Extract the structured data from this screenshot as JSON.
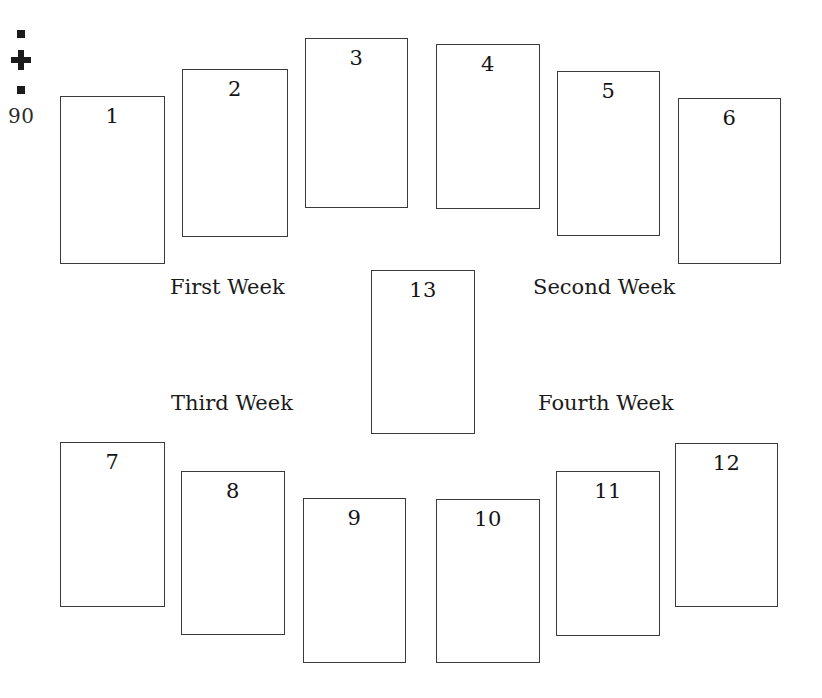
{
  "page": {
    "folio": "90",
    "width": 822,
    "height": 698,
    "background": "#ffffff",
    "ink": "#1b1b1b",
    "card_border": "#3a3a3a"
  },
  "ornament": {
    "name": "square-cross-square-ornament",
    "parts": [
      "square",
      "cross",
      "square"
    ]
  },
  "cards": [
    {
      "number": "1",
      "x": 60,
      "y": 96,
      "w": 105,
      "h": 168
    },
    {
      "number": "2",
      "x": 182,
      "y": 69,
      "w": 106,
      "h": 168
    },
    {
      "number": "3",
      "x": 305,
      "y": 38,
      "w": 103,
      "h": 170
    },
    {
      "number": "4",
      "x": 436,
      "y": 44,
      "w": 104,
      "h": 165
    },
    {
      "number": "5",
      "x": 557,
      "y": 71,
      "w": 103,
      "h": 165
    },
    {
      "number": "6",
      "x": 678,
      "y": 98,
      "w": 103,
      "h": 166
    },
    {
      "number": "7",
      "x": 60,
      "y": 442,
      "w": 105,
      "h": 165
    },
    {
      "number": "8",
      "x": 181,
      "y": 471,
      "w": 104,
      "h": 164
    },
    {
      "number": "9",
      "x": 303,
      "y": 498,
      "w": 103,
      "h": 165
    },
    {
      "number": "10",
      "x": 436,
      "y": 499,
      "w": 104,
      "h": 164
    },
    {
      "number": "11",
      "x": 556,
      "y": 471,
      "w": 104,
      "h": 165
    },
    {
      "number": "12",
      "x": 675,
      "y": 443,
      "w": 103,
      "h": 164
    },
    {
      "number": "13",
      "x": 371,
      "y": 270,
      "w": 104,
      "h": 164
    }
  ],
  "week_labels": [
    {
      "text": "First Week",
      "x": 170,
      "y": 276
    },
    {
      "text": "Second Week",
      "x": 533,
      "y": 276
    },
    {
      "text": "Third Week",
      "x": 171,
      "y": 392
    },
    {
      "text": "Fourth Week",
      "x": 538,
      "y": 392
    }
  ]
}
